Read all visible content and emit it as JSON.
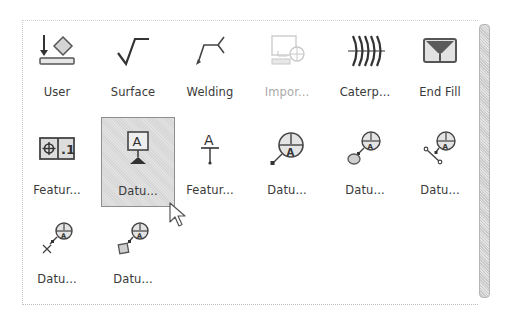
{
  "panel": {
    "rows": [
      [
        {
          "label": "User",
          "icon": "user-datum-icon",
          "enabled": true
        },
        {
          "label": "Surface",
          "icon": "surface-finish-icon",
          "enabled": true
        },
        {
          "label": "Welding",
          "icon": "welding-symbol-icon",
          "enabled": true
        },
        {
          "label": "Impor...",
          "icon": "import-symbol-icon",
          "enabled": false
        },
        {
          "label": "Caterp...",
          "icon": "caterpillar-icon",
          "enabled": true
        },
        {
          "label": "End Fill",
          "icon": "end-fill-icon",
          "enabled": true
        }
      ],
      [
        {
          "label": "Featur...",
          "icon": "feature-control-frame-icon",
          "enabled": true
        },
        {
          "label": "Datu...",
          "icon": "datum-feature-icon",
          "enabled": true,
          "selected": true
        },
        {
          "label": "Featur...",
          "icon": "feature-identifier-icon",
          "enabled": true
        },
        {
          "label": "Datu...",
          "icon": "datum-target-icon",
          "enabled": true
        },
        {
          "label": "Datu...",
          "icon": "datum-target-area-icon",
          "enabled": true
        },
        {
          "label": "Datu...",
          "icon": "datum-target-line-icon",
          "enabled": true
        }
      ],
      [
        {
          "label": "Datu...",
          "icon": "datum-target-point-icon",
          "enabled": true
        },
        {
          "label": "Datu...",
          "icon": "datum-target-square-icon",
          "enabled": true
        }
      ]
    ]
  },
  "colors": {
    "icon_dark": "#3c3c3c",
    "icon_fill": "#cfcfcf",
    "disabled": "#a9a9a9",
    "selection_border": "#8e8e8e"
  }
}
